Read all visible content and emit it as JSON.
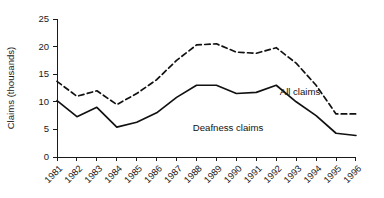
{
  "chart_data": {
    "type": "line",
    "title": "",
    "xlabel": "",
    "ylabel": "Claims (thousands)",
    "ylim": [
      0,
      25
    ],
    "yticks": [
      0,
      5,
      10,
      15,
      20,
      25
    ],
    "grid": false,
    "legend_position": "inline-annotation",
    "categories": [
      "1981",
      "1982",
      "1983",
      "1984",
      "1985",
      "1986",
      "1987",
      "1988",
      "1989",
      "1990",
      "1991",
      "1992",
      "1993",
      "1994",
      "1995",
      "1996"
    ],
    "series": [
      {
        "name": "All claims",
        "style": "dashed",
        "color": "#111111",
        "annotation": "All claims",
        "values": [
          13.7,
          11.0,
          12.0,
          9.5,
          11.5,
          14.0,
          17.5,
          20.3,
          20.5,
          19.0,
          18.8,
          19.8,
          17.0,
          13.0,
          7.8,
          7.8
        ]
      },
      {
        "name": "Deafness claims",
        "style": "solid",
        "color": "#111111",
        "annotation": "Deafness claims",
        "values": [
          10.2,
          7.3,
          9.0,
          5.4,
          6.3,
          8.0,
          10.8,
          13.0,
          13.0,
          11.5,
          11.7,
          13.0,
          10.0,
          7.5,
          4.3,
          3.9
        ]
      }
    ],
    "annotations": [
      {
        "text": "All claims",
        "x_px": 300,
        "y_px": 95
      },
      {
        "text": "Deafness claims",
        "x_px": 228,
        "y_px": 131
      }
    ]
  }
}
